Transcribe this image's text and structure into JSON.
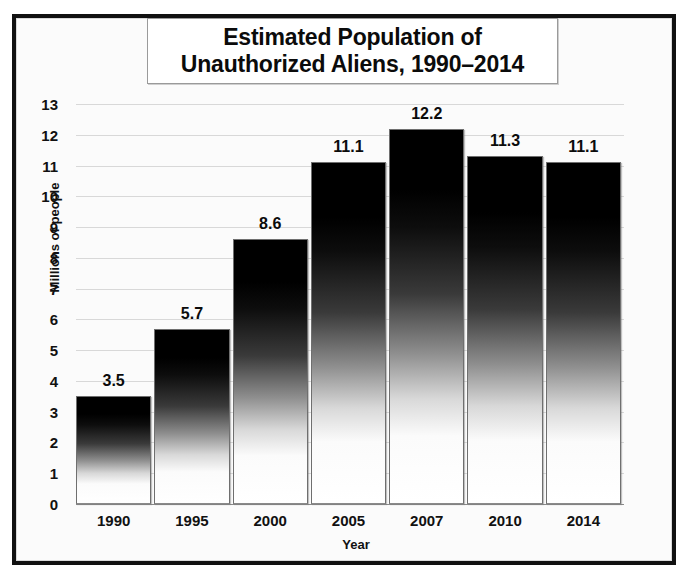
{
  "chart_data": {
    "type": "bar",
    "title": "Estimated Population of Unauthorized Aliens, 1990–2014",
    "title_lines": [
      "Estimated Population of",
      "Unauthorized Aliens, 1990–2014"
    ],
    "categories": [
      "1990",
      "1995",
      "2000",
      "2005",
      "2007",
      "2010",
      "2014"
    ],
    "values": [
      3.5,
      5.7,
      8.6,
      11.1,
      12.2,
      11.3,
      11.1
    ],
    "value_labels": [
      "3.5",
      "5.7",
      "8.6",
      "11.1",
      "12.2",
      "11.3",
      "11.1"
    ],
    "xlabel": "Year",
    "ylabel": "Millions of people",
    "ylim": [
      0,
      13
    ],
    "ytick_step": 1,
    "ytick_labels": [
      "13",
      "12",
      "11",
      "10",
      "9",
      "8",
      "7",
      "6",
      "5",
      "4",
      "3",
      "2",
      "1",
      "0"
    ],
    "grid": true,
    "legend": null,
    "bar_style": "vertical-gradient-black-to-white",
    "colors": {
      "bar_top": "#000000",
      "bar_bottom": "#ffffff",
      "bar_outline": "#6f6f6f",
      "gridline": "#d8d8d8",
      "axis": "#8a8a8a",
      "text": "#111111",
      "frame": "#111111",
      "plot_background": "#fbfbfb",
      "title_background": "#ffffff"
    }
  }
}
